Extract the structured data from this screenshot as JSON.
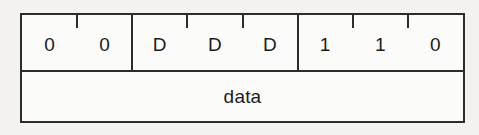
{
  "figure": {
    "kind": "bit-field-diagram",
    "background_color": "#f3f2f0",
    "line_color": "#2e2b29",
    "cell_fill_color": "#fbfbfa",
    "text_color": "#1d1b1a",
    "bit_row": {
      "cells": [
        {
          "label": "0",
          "boundary": "outer"
        },
        {
          "label": "0",
          "boundary": "tick"
        },
        {
          "label": "D",
          "boundary": "group"
        },
        {
          "label": "D",
          "boundary": "tick"
        },
        {
          "label": "D",
          "boundary": "tick"
        },
        {
          "label": "1",
          "boundary": "group"
        },
        {
          "label": "1",
          "boundary": "tick"
        },
        {
          "label": "0",
          "boundary": "tick"
        }
      ]
    },
    "data_row": {
      "label": "data"
    }
  }
}
